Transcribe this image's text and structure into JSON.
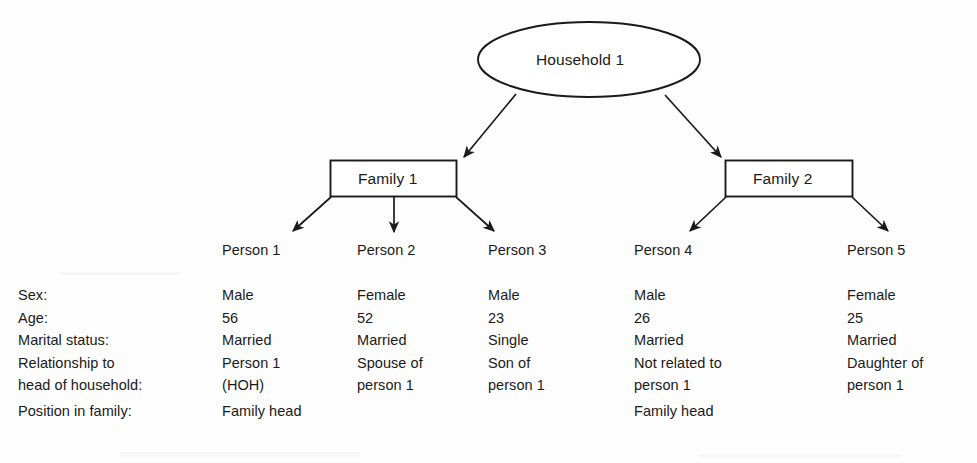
{
  "figure": {
    "root": {
      "label": "Household 1",
      "shape": "ellipse"
    },
    "families": [
      {
        "label": "Family 1",
        "shape": "rectangle"
      },
      {
        "label": "Family 2",
        "shape": "rectangle"
      }
    ],
    "persons": [
      {
        "label": "Person 1"
      },
      {
        "label": "Person 2"
      },
      {
        "label": "Person 3"
      },
      {
        "label": "Person 4"
      },
      {
        "label": "Person 5"
      }
    ],
    "row_labels": [
      "Sex:",
      "Age:",
      "Marital status:",
      "Relationship to",
      "head of household:",
      "Position in family:"
    ],
    "attributes": {
      "sex": [
        "Male",
        "Female",
        "Male",
        "Male",
        "Female"
      ],
      "age": [
        "56",
        "52",
        "23",
        "26",
        "25"
      ],
      "marital": [
        "Married",
        "Married",
        "Single",
        "Married",
        "Married"
      ],
      "relationship_line1": [
        "Person 1",
        "Spouse of",
        "Son of",
        "Not related to",
        "Daughter of"
      ],
      "relationship_line2": [
        "(HOH)",
        "person 1",
        "person 1",
        "person 1",
        "person 1"
      ],
      "position": [
        "Family head",
        "",
        "",
        "Family head",
        ""
      ]
    },
    "colors": {
      "stroke": "#1a1a1a",
      "text": "#1a1a1a",
      "background": "#fdfdfd"
    }
  }
}
